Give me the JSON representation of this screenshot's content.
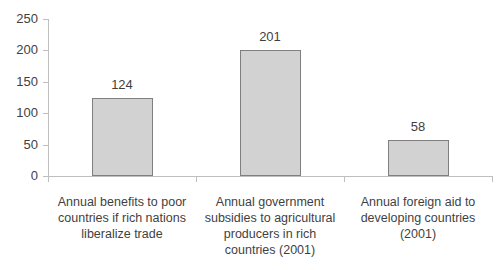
{
  "chart_data": {
    "type": "bar",
    "title": "",
    "xlabel": "",
    "ylabel": "",
    "categories": [
      "Annual benefits to poor countries if rich nations liberalize trade",
      "Annual government subsidies to agricultural producers in rich countries (2001)",
      "Annual foreign aid to developing countries (2001)"
    ],
    "category_label_lines": [
      [
        "Annual benefits to poor",
        "countries if rich nations",
        "liberalize trade"
      ],
      [
        "Annual government",
        "subsidies to agricultural",
        "producers in rich",
        "countries (2001)"
      ],
      [
        "Annual foreign aid to",
        "developing countries",
        "(2001)"
      ]
    ],
    "values": [
      124,
      201,
      58
    ],
    "value_labels": [
      "124",
      "201",
      "58"
    ],
    "y_ticks": [
      0,
      50,
      100,
      150,
      200,
      250
    ],
    "ylim": [
      0,
      250
    ],
    "grid": false,
    "legend": false,
    "colors": {
      "bar_fill": "#d2d2d2",
      "bar_border": "#7f7f7f",
      "axis_line": "#bfbfbf",
      "text": "#3f3f3f",
      "background": "#ffffff"
    }
  }
}
